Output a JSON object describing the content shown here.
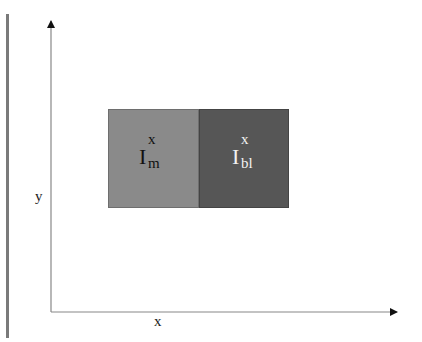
{
  "diagram": {
    "axes": {
      "x_label": "x",
      "y_label": "y",
      "axis_color": "#888888"
    },
    "regions": [
      {
        "id": "m",
        "base": "I",
        "superscript": "x",
        "subscript": "m",
        "fill": "#8a8a8a",
        "text_color": "#111111"
      },
      {
        "id": "bl",
        "base": "I",
        "superscript": "x",
        "subscript": "bl",
        "fill": "#565656",
        "text_color": "#f2f2f2"
      }
    ]
  }
}
